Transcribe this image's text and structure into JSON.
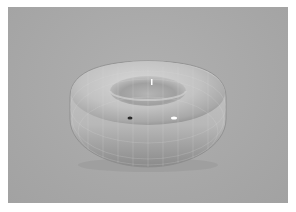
{
  "scene": {
    "subject": "torus",
    "description": "Grayscale 3D render of a smooth torus (donut) with faint wireframe grid lines on a flat gray background",
    "colors": {
      "page_border": "#ffffff",
      "background": "#a9a9a9",
      "torus_light": "#d4d4d4",
      "torus_mid": "#bdbdbd",
      "torus_shadow": "#8f8f8f",
      "specular": "#ffffff"
    }
  }
}
